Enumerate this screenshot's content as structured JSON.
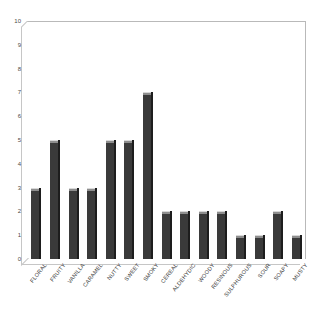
{
  "chart_data": {
    "type": "bar",
    "title": "",
    "subtitle": "",
    "xlabel": "",
    "ylabel": "",
    "ylim": [
      0,
      10
    ],
    "ytick_labels": [
      "10",
      "9",
      "8",
      "7",
      "6",
      "5",
      "4",
      "3",
      "2",
      "1",
      "0"
    ],
    "yticks": [
      10,
      9,
      8,
      7,
      6,
      5,
      4,
      3,
      2,
      1,
      0
    ],
    "grid": false,
    "legend": false,
    "legend_position": "none",
    "categories": [
      "FLORAL",
      "FRUITY",
      "VANILLA",
      "CARAMEL",
      "NUTTY",
      "SWEET",
      "SMOKY",
      "CEREAL",
      "ALDEHYDIC",
      "WOODY",
      "RESINOUS",
      "SULPHUROUS",
      "SOUR",
      "SOAPY",
      "MUSTY"
    ],
    "values": [
      3,
      5,
      3,
      3,
      5,
      5,
      7,
      2,
      2,
      2,
      2,
      1,
      1,
      2,
      1
    ],
    "annotations": []
  },
  "style": {
    "bar_color": "#3a3a3a",
    "bar_edge_color": "#1d1d1d",
    "bar_top_color": "#8e8e8e",
    "axis_color": "#c6c6c6",
    "tick_text_color": "#4a4a4a",
    "label_text_color": "#3b3b3b",
    "background": "#ffffff"
  }
}
